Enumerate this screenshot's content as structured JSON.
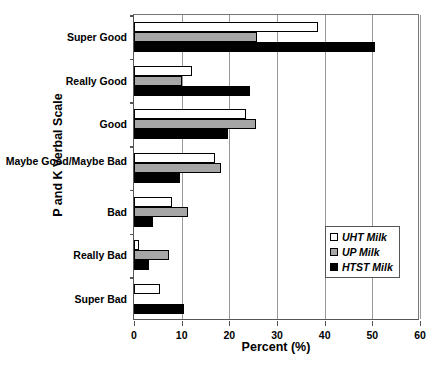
{
  "chart_data": {
    "type": "bar",
    "orientation": "horizontal",
    "title": "",
    "xlabel": "Percent (%)",
    "ylabel": "P and K Verbal Scale",
    "xlim": [
      0,
      60
    ],
    "xticks": [
      "0",
      "10",
      "20",
      "30",
      "40",
      "50",
      "60"
    ],
    "grid": "vertical",
    "legend_position": "right-lower",
    "categories": [
      "Super Good",
      "Really Good",
      "Good",
      "Maybe Good/Maybe Bad",
      "Bad",
      "Really Bad",
      "Super Bad"
    ],
    "series": [
      {
        "name": "UHT Milk",
        "color": "#ffffff",
        "values": [
          38.5,
          12.2,
          23.5,
          17.0,
          8.0,
          1.0,
          5.5
        ]
      },
      {
        "name": "UP Milk",
        "color": "#a6a6a6",
        "values": [
          25.7,
          10.1,
          25.6,
          18.2,
          11.3,
          7.3,
          0.0
        ]
      },
      {
        "name": "HTST Milk",
        "color": "#000000",
        "values": [
          50.5,
          24.3,
          19.7,
          9.6,
          4.0,
          3.1,
          10.5
        ]
      }
    ]
  },
  "axes": {
    "y_title": "P and K Verbal Scale",
    "x_title": "Percent (%)"
  },
  "legend": {
    "items": [
      {
        "label": "UHT Milk",
        "swatch": "white-square-icon"
      },
      {
        "label": "UP Milk",
        "swatch": "gray-square-icon"
      },
      {
        "label": "HTST Milk",
        "swatch": "black-square-icon"
      }
    ]
  }
}
